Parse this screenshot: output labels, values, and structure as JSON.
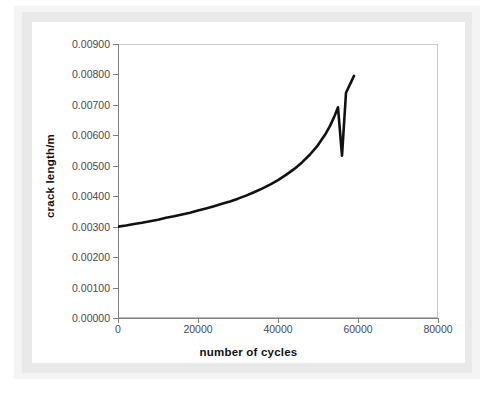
{
  "chart_data": {
    "type": "line",
    "title": "",
    "xlabel": "number of cycles",
    "ylabel": "crack length/m",
    "xlim": [
      0,
      80000
    ],
    "ylim": [
      0,
      0.009
    ],
    "grid": false,
    "legend": null,
    "xticks": [
      "0",
      "20000",
      "40000",
      "60000",
      "80000"
    ],
    "xtick_values": [
      0,
      20000,
      40000,
      60000,
      80000
    ],
    "yticks": [
      "0.00000",
      "0.00100",
      "0.00200",
      "0.00300",
      "0.00400",
      "0.00500",
      "0.00600",
      "0.00700",
      "0.00800",
      "0.00900"
    ],
    "ytick_values": [
      0.0,
      0.001,
      0.002,
      0.003,
      0.004,
      0.005,
      0.006,
      0.007,
      0.008,
      0.009
    ],
    "line_color": "#111111",
    "line_width": 2.6,
    "series": [
      {
        "name": "crack growth",
        "x": [
          0,
          2000,
          4000,
          6000,
          8000,
          10000,
          12000,
          14000,
          16000,
          18000,
          20000,
          22000,
          24000,
          26000,
          28000,
          30000,
          32000,
          34000,
          36000,
          38000,
          40000,
          42000,
          44000,
          46000,
          48000,
          50000,
          52000,
          53000,
          54000,
          55000,
          56000,
          57000,
          57800,
          58400,
          58800,
          59000
        ],
        "y": [
          0.003,
          0.00304,
          0.00309,
          0.00313,
          0.00318,
          0.00323,
          0.00329,
          0.00334,
          0.0034,
          0.00346,
          0.00353,
          0.0036,
          0.00367,
          0.00375,
          0.00383,
          0.00392,
          0.00402,
          0.00413,
          0.00425,
          0.00438,
          0.00453,
          0.0047,
          0.00489,
          0.00511,
          0.00537,
          0.00568,
          0.00607,
          0.00631,
          0.00659,
          0.00692,
          0.00533,
          0.0074,
          0.00762,
          0.00779,
          0.0079,
          0.00795
        ]
      }
    ]
  },
  "axes": {
    "x_title": "number of cycles",
    "y_title": "crack length/m"
  }
}
